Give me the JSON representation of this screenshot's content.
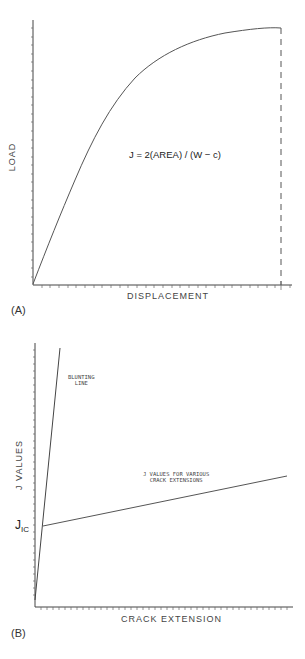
{
  "panel_a": {
    "tag": "(A)",
    "y_axis_label": "LOAD",
    "x_axis_label": "DISPLACEMENT",
    "formula": "J = 2(AREA) / (W − c)",
    "curve": "load-displacement curve rising steeply then leveling off to a maximum; dashed vertical line drops from curve end to x-axis"
  },
  "panel_b": {
    "tag": "(B)",
    "y_axis_label": "J VALUES",
    "x_axis_label": "CRACK EXTENSION",
    "jic_label": "J",
    "jic_subscript": "IC",
    "blunting_line_label": [
      "BLUNTING",
      "LINE"
    ],
    "j_values_label": [
      "J VALUES FOR VARIOUS",
      "CRACK EXTENSIONS"
    ]
  },
  "colors": {
    "line": "#555555",
    "axis": "#444444",
    "text": "#444444"
  }
}
